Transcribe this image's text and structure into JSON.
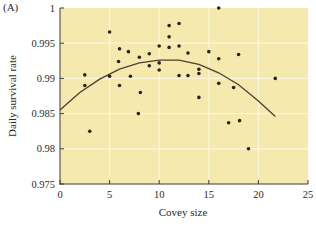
{
  "chart_data": {
    "type": "scatter",
    "panel_label": "(A)",
    "title": "",
    "xlabel": "Covey size",
    "ylabel": "Daily survival rate",
    "xlim": [
      0,
      25
    ],
    "ylim": [
      0.975,
      1.0
    ],
    "xticks": [
      0,
      5,
      10,
      15,
      20,
      25
    ],
    "xtick_labels": [
      "0",
      "5",
      "10",
      "15",
      "20",
      "25"
    ],
    "yticks": [
      0.975,
      0.98,
      0.985,
      0.99,
      0.995,
      1.0
    ],
    "ytick_labels": [
      "0.975",
      "0.98",
      "0.985",
      "0.99",
      "0.995",
      "1"
    ],
    "grid": true,
    "legend": null,
    "colors": {
      "plot_background": "#f6e9ad",
      "gridline": "#fbf6dc",
      "point": "#2a2420",
      "curve": "#4a3f36",
      "axis": "#3a3a3a"
    },
    "series": [
      {
        "name": "observed coveys",
        "kind": "scatter",
        "points": [
          [
            2.5,
            0.9905
          ],
          [
            2.5,
            0.989
          ],
          [
            3.0,
            0.9825
          ],
          [
            5.0,
            0.9966
          ],
          [
            5.0,
            0.9903
          ],
          [
            5.9,
            0.9924
          ],
          [
            6.0,
            0.9942
          ],
          [
            6.0,
            0.989
          ],
          [
            6.9,
            0.9938
          ],
          [
            7.1,
            0.9903
          ],
          [
            8.0,
            0.993
          ],
          [
            8.1,
            0.988
          ],
          [
            7.9,
            0.985
          ],
          [
            9.0,
            0.9935
          ],
          [
            9.0,
            0.9918
          ],
          [
            10.0,
            0.9946
          ],
          [
            10.0,
            0.9922
          ],
          [
            10.0,
            0.9912
          ],
          [
            11.0,
            0.9975
          ],
          [
            11.0,
            0.9959
          ],
          [
            11.0,
            0.9944
          ],
          [
            12.0,
            0.9978
          ],
          [
            12.0,
            0.9946
          ],
          [
            12.0,
            0.9904
          ],
          [
            12.9,
            0.9936
          ],
          [
            12.9,
            0.9904
          ],
          [
            14.0,
            0.9913
          ],
          [
            14.0,
            0.9907
          ],
          [
            14.0,
            0.9873
          ],
          [
            15.0,
            0.9938
          ],
          [
            16.0,
            1.0
          ],
          [
            16.0,
            0.9928
          ],
          [
            16.0,
            0.9893
          ],
          [
            17.0,
            0.9837
          ],
          [
            17.5,
            0.9887
          ],
          [
            18.0,
            0.9934
          ],
          [
            18.1,
            0.984
          ],
          [
            19.0,
            0.98
          ],
          [
            21.7,
            0.99
          ]
        ]
      },
      {
        "name": "quadratic fit",
        "kind": "line",
        "points": [
          [
            0.0,
            0.9855
          ],
          [
            2.0,
            0.988
          ],
          [
            4.0,
            0.9899
          ],
          [
            6.0,
            0.9913
          ],
          [
            8.0,
            0.9922
          ],
          [
            10.0,
            0.9926
          ],
          [
            12.0,
            0.9926
          ],
          [
            14.0,
            0.992
          ],
          [
            16.0,
            0.9908
          ],
          [
            18.0,
            0.9891
          ],
          [
            20.0,
            0.9868
          ],
          [
            21.7,
            0.9846
          ]
        ]
      }
    ]
  }
}
